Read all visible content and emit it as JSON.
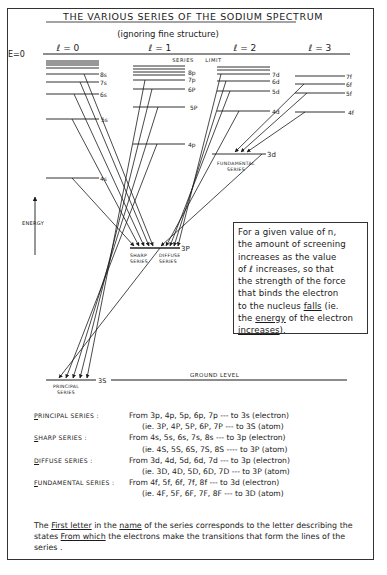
{
  "title": "THE VARIOUS SERIES OF THE SODIUM SPECTRUM",
  "subtitle": "(ignoring fine structure)",
  "energy_zero_label": "E=0",
  "series_limit_label": "SERIES     LIMIT",
  "energy_axis_label": "ENERGY",
  "columns": [
    {
      "label": "ℓ = 0",
      "levels": [
        "8s",
        "7s",
        "6s",
        "5s",
        "4s",
        "3s"
      ]
    },
    {
      "label": "ℓ = 1",
      "levels": [
        "8p",
        "7p",
        "6p",
        "5p",
        "4p",
        "3p"
      ]
    },
    {
      "label": "ℓ = 2",
      "levels": [
        "7d",
        "6d",
        "5d",
        "4d",
        "3d"
      ]
    },
    {
      "label": "ℓ = 3",
      "levels": [
        "7f",
        "6f",
        "5f",
        "4f"
      ]
    }
  ],
  "level_labels": {
    "s8": "8s",
    "s7": "7s",
    "s6": "6s",
    "s5": "5s",
    "s4": "4s",
    "s3": "3S",
    "p8": "8p",
    "p7": "7p",
    "p6": "6P",
    "p5": "5P",
    "p4": "4p",
    "p3": "3P",
    "d7": "7d",
    "d6": "6d",
    "d5": "5d",
    "d4": "4d",
    "d3": "3d",
    "f7": "7f",
    "f6": "6f",
    "f5": "5f",
    "f4": "4f"
  },
  "ground_level_label": "GROUND LEVEL",
  "series_labels": {
    "principal": [
      "PRINCIPAL",
      "SERIES"
    ],
    "sharp": [
      "SHARP",
      "SERIES"
    ],
    "diffuse": [
      "DIFFUSE",
      "SERIES"
    ],
    "fundamental": [
      "FUNDAMENTAL",
      "SERIES"
    ]
  },
  "note_box": {
    "line1": "For a given value of n,",
    "line2": "the amount of screening",
    "line3": "increases as the value",
    "line4": "of ℓ increases, so that",
    "line5": "the strength of the force",
    "line6": "that binds the electron",
    "line7a": "to the nucleus ",
    "line7u": "falls",
    "line7b": " (ie.",
    "line8a": "the ",
    "line8u": "energy",
    "line8b": " of the electron",
    "line9u": "increases",
    "line9b": ")."
  },
  "series_table": [
    {
      "name_first": "P",
      "name_rest": "RINCIPAL SERIES :",
      "electron": "From 3p, 4p, 5p, 6p, 7p --- to 3s (electron)",
      "atom": "(ie. 3P, 4P, 5P, 6P, 7P --- to 3S (atom)"
    },
    {
      "name_first": "S",
      "name_rest": "HARP SERIES :",
      "electron": "From 4s, 5s, 6s, 7s, 8s --- to 3p (electron)",
      "atom": "(ie. 4S, 5S, 6S, 7S, 8S ---- to 3P (atom)"
    },
    {
      "name_first": "D",
      "name_rest": "IFFUSE SERIES :",
      "electron": "From 3d, 4d, 5d, 6d, 7d --- to 3p (electron)",
      "atom": "(ie. 3D, 4D, 5D, 6D, 7D --- to 3P (atom)"
    },
    {
      "name_first": "F",
      "name_rest": "UNDAMENTAL SERIES :",
      "electron": "From 4f, 5f, 6f, 7f, 8f --- to 3d (electron)",
      "atom": "(ie. 4F, 5F, 6F, 7F, 8F --- to 3D (atom)"
    }
  ],
  "footer": {
    "p1": "The ",
    "u1": "First letter",
    "p2": " in the ",
    "u2": "name",
    "p3": " of the series corresponds to the letter describing the states ",
    "u3": "From which",
    "p4": " the electrons make the transitions that form the lines of the series ."
  }
}
